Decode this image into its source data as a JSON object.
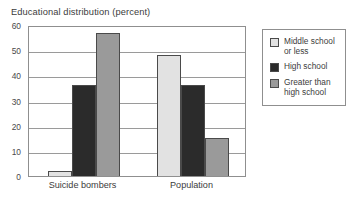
{
  "chart_data": {
    "type": "bar",
    "title": "Educational distribution (percent)",
    "xlabel": "",
    "ylabel": "",
    "ylim": [
      0,
      60
    ],
    "ytick_step": 10,
    "yticks": [
      "0",
      "10",
      "20",
      "30",
      "40",
      "50",
      "60"
    ],
    "grid": true,
    "legend_position": "right",
    "categories": [
      "Suicide bombers",
      "Population"
    ],
    "series": [
      {
        "name": "Middle school or less",
        "color": "#e2e2e2",
        "values": [
          2,
          48
        ]
      },
      {
        "name": "High school",
        "color": "#2b2b2b",
        "values": [
          36,
          36
        ]
      },
      {
        "name": "Greater than high school",
        "color": "#9a9a9a",
        "values": [
          57,
          15
        ]
      }
    ]
  },
  "legend": {
    "entries": [
      {
        "label": "Middle school or less",
        "color": "#e2e2e2"
      },
      {
        "label": "High school",
        "color": "#2b2b2b"
      },
      {
        "label": "Greater than high school",
        "color": "#9a9a9a"
      }
    ]
  },
  "colors": {
    "background": "#ffffff",
    "axis": "#8f8f8f",
    "gridline": "#9a9a9a",
    "text": "#3c3c3c",
    "bar_outline": "#4a4a4a"
  }
}
